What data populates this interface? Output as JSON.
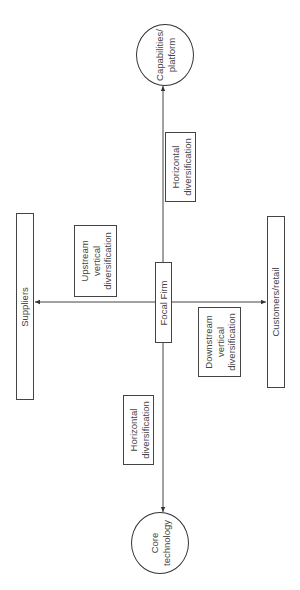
{
  "diagram": {
    "nodes": {
      "capabilities": {
        "label": "Capabilities/\nplatform",
        "shape": "circle"
      },
      "focal_firm": {
        "label": "Focal Firm",
        "shape": "rectangle"
      },
      "suppliers": {
        "label": "Suppliers",
        "shape": "rectangle"
      },
      "customers": {
        "label": "Customers/retail",
        "shape": "rectangle"
      },
      "core_technology": {
        "label": "Core\ntechnology",
        "shape": "circle"
      }
    },
    "edge_labels": {
      "upper_horizontal": "Horizontal\ndiversification",
      "upstream": "Upstream\nvertical\ndiversification",
      "downstream": "Downstream\nvertical\ndiversification",
      "lower_horizontal": "Horizontal\ndiversification"
    },
    "edges": [
      {
        "from": "focal_firm",
        "to": "capabilities",
        "label": "Horizontal diversification"
      },
      {
        "from": "focal_firm",
        "to": "suppliers",
        "label": "Upstream vertical diversification"
      },
      {
        "from": "focal_firm",
        "to": "customers",
        "label": "Downstream vertical diversification"
      },
      {
        "from": "focal_firm",
        "to": "core_technology",
        "label": "Horizontal diversification"
      }
    ],
    "colors": {
      "stroke": "#333333",
      "background": "#ffffff",
      "text": "#444444"
    }
  }
}
